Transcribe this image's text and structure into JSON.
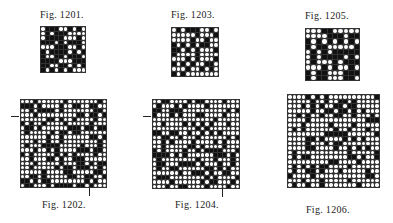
{
  "figures": [
    {
      "id": "1201",
      "label": "Fig. 1201.",
      "size": 10,
      "seed": 1201,
      "density": 0.5
    },
    {
      "id": "1202",
      "label": "Fig. 1202.",
      "size": 20,
      "seed": 1202,
      "density": 0.3
    },
    {
      "id": "1203",
      "label": "Fig. 1203.",
      "size": 10,
      "seed": 1203,
      "density": 0.5
    },
    {
      "id": "1204",
      "label": "Fig. 1204.",
      "size": 20,
      "seed": 1204,
      "density": 0.3
    },
    {
      "id": "1205",
      "label": "Fig. 1205.",
      "size": 10,
      "seed": 1205,
      "density": 0.5
    },
    {
      "id": "1206",
      "label": "Fig. 1206.",
      "size": 20,
      "seed": 1206,
      "density": 0.25
    }
  ]
}
